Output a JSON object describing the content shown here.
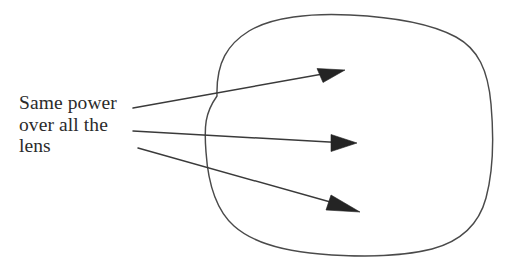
{
  "figure": {
    "title": "Same power over all the lens",
    "type": "diagram",
    "width": 521,
    "height": 267,
    "background_color": "#ffffff"
  },
  "caption": {
    "name": "same-power-label",
    "lines": [
      "Same power",
      "over all the",
      "lens"
    ],
    "text_color": "#2b2b2b",
    "font_size_px": 19.5
  },
  "lens": {
    "label": "lens-outline",
    "description": "hand-drawn rounded square lens boundary",
    "stroke_color": "#4a4a4a",
    "stroke_width": 1.45,
    "bounds": {
      "left": 203,
      "top": 15,
      "right": 493,
      "bottom": 256
    },
    "path": "M 217 96 C 216 62 228 44 249 31 C 272 17 311 13 350 15 C 392 17 432 24 456 37 C 478 49 488 70 491 104 C 494 138 493 172 486 198 C 479 224 462 241 432 249 C 400 257 356 257 320 254 C 284 251 253 243 234 226 C 216 210 208 182 206 152 C 204 126 205 113 217 96 Z"
  },
  "rays": {
    "label": "power-rays",
    "stroke_color": "#3a3a3a",
    "arrowhead_color": "#242424",
    "items": [
      {
        "name": "ray-top",
        "from": {
          "x": 133,
          "y": 108
        },
        "to": {
          "x": 345,
          "y": 70
        },
        "direction": "up-right"
      },
      {
        "name": "ray-middle",
        "from": {
          "x": 133,
          "y": 131
        },
        "to": {
          "x": 357,
          "y": 143
        },
        "direction": "right"
      },
      {
        "name": "ray-bottom",
        "from": {
          "x": 138,
          "y": 148
        },
        "to": {
          "x": 360,
          "y": 212
        },
        "direction": "down-right"
      }
    ]
  }
}
